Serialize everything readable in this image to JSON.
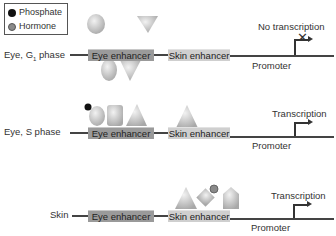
{
  "legend": {
    "items": [
      {
        "label": "Phosphate",
        "color": "#111111"
      },
      {
        "label": "Hormone",
        "color": "#8a8a8a"
      }
    ]
  },
  "rows": [
    {
      "name": "Eye, G1 phase",
      "label_main": "Eye, G",
      "label_sub": "1",
      "label_tail": " phase",
      "eye_enhancer": "Eye enhancer",
      "skin_enhancer": "Skin enhancer",
      "promoter": "Promoter",
      "outcome": "No transcription"
    },
    {
      "name": "Eye, S phase",
      "label": "Eye, S phase",
      "eye_enhancer": "Eye enhancer",
      "skin_enhancer": "Skin enhancer",
      "promoter": "Promoter",
      "outcome": "Transcription"
    },
    {
      "name": "Skin",
      "label": "Skin",
      "eye_enhancer": "Eye enhancer",
      "skin_enhancer": "Skin enhancer",
      "promoter": "Promoter",
      "outcome": "Transcription"
    }
  ],
  "colors": {
    "eye_enhancer": "#9a9a9a",
    "skin_enhancer": "#cfcfcf",
    "dna_line": "#444444",
    "protein_fill": "#c4c4c4"
  }
}
